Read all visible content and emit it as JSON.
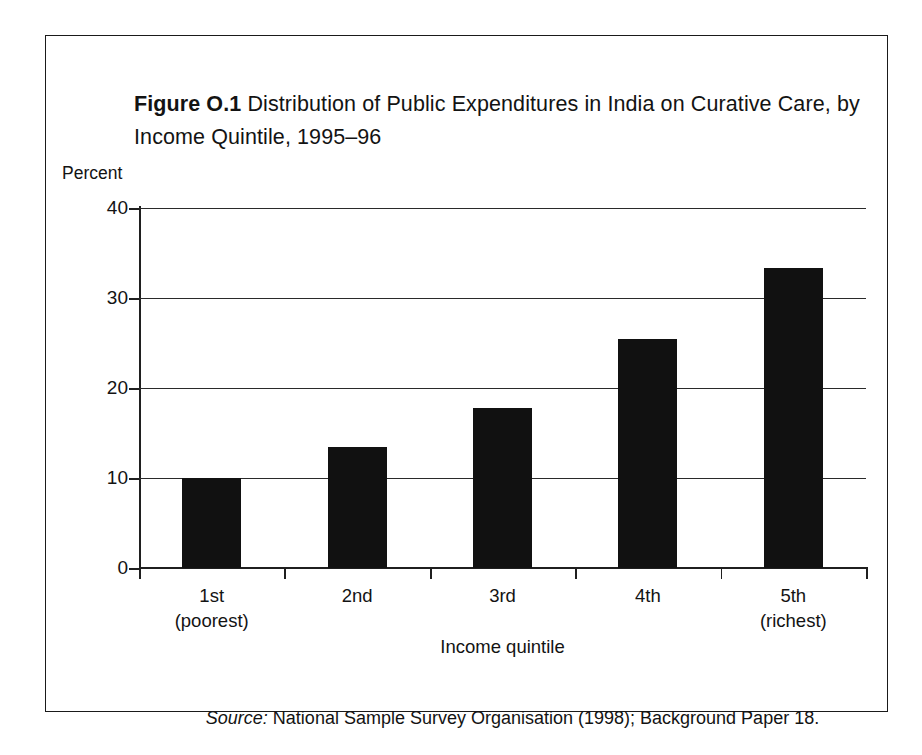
{
  "figure": {
    "label": "Figure O.1",
    "title_text": " Distribution of Public Expenditures in India on Curative Care, by Income Quintile, 1995–96",
    "source_word": "Source:",
    "source_text": " National Sample Survey Organisation (1998); Background Paper 18.",
    "frame_color": "#1a1a1a",
    "bar_color": "#111111"
  },
  "chart_data": {
    "type": "bar",
    "title": "Figure O.1 Distribution of Public Expenditures in India on Curative Care, by Income Quintile, 1995–96",
    "categories": [
      "1st\n(poorest)",
      "2nd",
      "3rd",
      "4th",
      "5th\n(richest)"
    ],
    "category_labels_plain": [
      "1st (poorest)",
      "2nd",
      "3rd",
      "4th",
      "5th (richest)"
    ],
    "values": [
      10.0,
      13.5,
      17.8,
      25.5,
      33.3
    ],
    "xlabel": "Income quintile",
    "ylabel": "Percent",
    "ylim": [
      0,
      40
    ],
    "yticks": [
      0,
      10,
      20,
      30,
      40
    ],
    "ytick_labels": [
      "0",
      "10",
      "20",
      "30",
      "40"
    ],
    "grid": true,
    "legend": "none",
    "series": [
      {
        "name": "Share of public expenditure on curative care",
        "values": [
          10.0,
          13.5,
          17.8,
          25.5,
          33.3
        ]
      }
    ]
  }
}
